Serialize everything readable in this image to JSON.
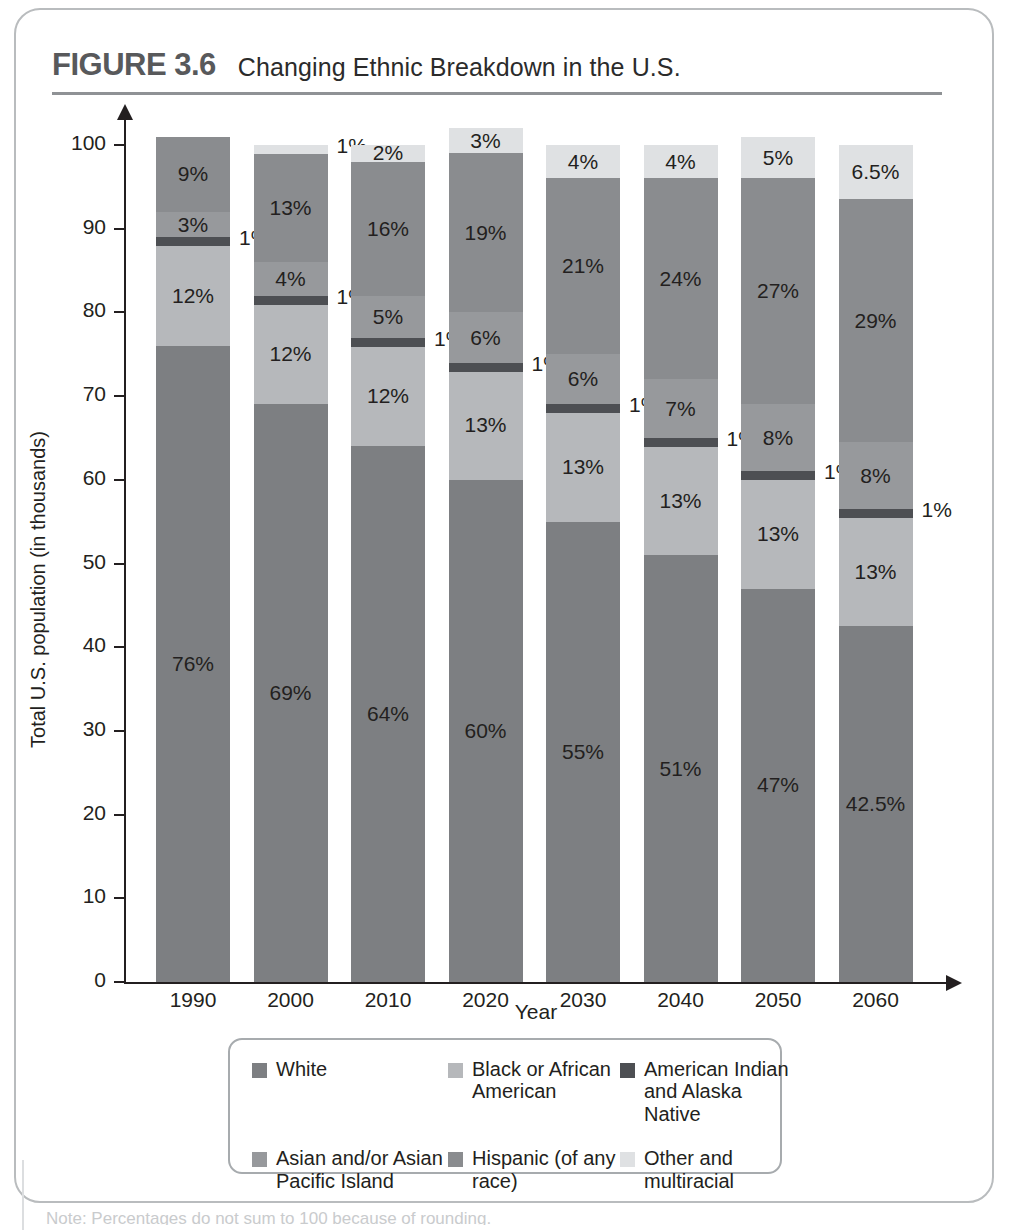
{
  "figure": {
    "number": "FIGURE 3.6",
    "title": "Changing Ethnic Breakdown in the U.S.",
    "bottom_caption": "Note: Percentages do not sum to 100 because of rounding."
  },
  "axes": {
    "y_title": "Total U.S. population (in thousands)",
    "x_title": "Year",
    "y_ticks": [
      "0",
      "10",
      "20",
      "30",
      "40",
      "50",
      "60",
      "70",
      "80",
      "90",
      "100"
    ],
    "y_min": 0,
    "y_max": 100
  },
  "legend": {
    "items": [
      {
        "label": "White",
        "color": "#7d7f82",
        "name": "white"
      },
      {
        "label": "Black or African American",
        "color": "#b6b8bb",
        "name": "black-or-african-american"
      },
      {
        "label": "American Indian and Alaska Native",
        "color": "#4d4f53",
        "name": "american-indian-and-alaska-native"
      },
      {
        "label": "Asian and/or Asian Pacific Island",
        "color": "#97999c",
        "name": "asian-and-or-asian-pacific-island"
      },
      {
        "label": "Hispanic (of any race)",
        "color": "#8a8c8f",
        "name": "hispanic"
      },
      {
        "label": "Other and multiracial",
        "color": "#dfe1e3",
        "name": "other-and-multiracial"
      }
    ]
  },
  "chart_data": {
    "type": "bar",
    "stacked": true,
    "title": "Changing Ethnic Breakdown in the U.S.",
    "xlabel": "Year",
    "ylabel": "Total U.S. population (in thousands)",
    "ylim": [
      0,
      100
    ],
    "grid": false,
    "legend_position": "bottom",
    "categories": [
      "1990",
      "2000",
      "2010",
      "2020",
      "2030",
      "2040",
      "2050",
      "2060"
    ],
    "series": [
      {
        "name": "White",
        "color": "#7d7f82",
        "values": [
          76,
          69,
          64,
          60,
          55,
          51,
          47,
          42.5
        ],
        "labels": [
          "76%",
          "69%",
          "64%",
          "60%",
          "55%",
          "51%",
          "47%",
          "42.5%"
        ]
      },
      {
        "name": "Black or African American",
        "color": "#b6b8bb",
        "values": [
          12,
          12,
          12,
          13,
          13,
          13,
          13,
          13
        ],
        "labels": [
          "12%",
          "12%",
          "12%",
          "13%",
          "13%",
          "13%",
          "13%",
          "13%"
        ]
      },
      {
        "name": "American Indian and Alaska Native",
        "color": "#4d4f53",
        "values": [
          1,
          1,
          1,
          1,
          1,
          1,
          1,
          1
        ],
        "labels": [
          "1%",
          "1%",
          "1%",
          "1%",
          "1%",
          "1%",
          "1%",
          "1%"
        ]
      },
      {
        "name": "Asian and/or Asian Pacific Island",
        "color": "#97999c",
        "values": [
          3,
          4,
          5,
          6,
          6,
          7,
          8,
          8
        ],
        "labels": [
          "3%",
          "4%",
          "5%",
          "6%",
          "6%",
          "7%",
          "8%",
          "8%"
        ]
      },
      {
        "name": "Hispanic (of any race)",
        "color": "#8a8c8f",
        "values": [
          9,
          13,
          16,
          19,
          21,
          24,
          27,
          29
        ],
        "labels": [
          "9%",
          "13%",
          "16%",
          "19%",
          "21%",
          "24%",
          "27%",
          "29%"
        ]
      },
      {
        "name": "Other and multiracial",
        "color": "#dfe1e3",
        "values": [
          0,
          1,
          2,
          3,
          4,
          4,
          5,
          6.5
        ],
        "labels": [
          "",
          "1%",
          "2%",
          "3%",
          "4%",
          "4%",
          "5%",
          "6.5%"
        ]
      }
    ],
    "bar_totals": [
      101,
      100,
      100,
      102,
      100,
      100,
      101,
      100
    ]
  }
}
